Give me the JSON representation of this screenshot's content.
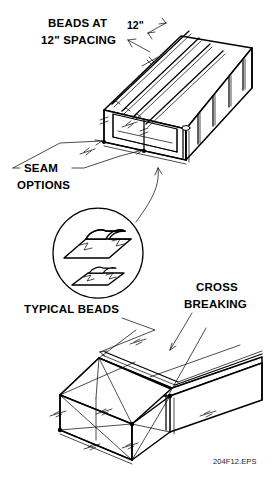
{
  "figure": {
    "id": "204F12.EPS",
    "background_color": "#ffffff",
    "line_color": "#000000"
  },
  "labels": {
    "beads_line1": "BEADS AT",
    "beads_line2": "12\" SPACING",
    "dimension_12in": "12\"",
    "seam_line1": "SEAM",
    "seam_line2": "OPTIONS",
    "typical_beads": "TYPICAL BEADS",
    "cross_line1": "CROSS",
    "cross_line2": "BREAKING"
  },
  "detail_circle": {
    "name": "typical-beads-detail",
    "center_x": 98,
    "center_y": 253,
    "radius": 45,
    "profiles": [
      {
        "name": "large-bead-profile",
        "description": "raised rounded bead section on sheet metal panel"
      },
      {
        "name": "small-bead-profile",
        "description": "smaller rounded bead section on sheet metal panel"
      }
    ]
  },
  "upper_duct": {
    "name": "beaded-duct",
    "description": "isometric rectangular duct with parallel beads at 12 inch spacing on top and side faces",
    "bead_count_top": 4,
    "bead_count_side": 4
  },
  "lower_duct": {
    "name": "cross-broken-duct",
    "description": "isometric rectangular duct showing diagonal cross breaking creases on panel faces"
  }
}
